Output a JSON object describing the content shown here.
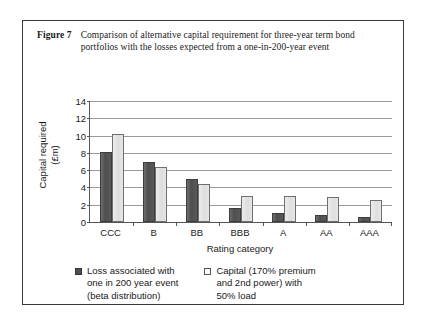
{
  "figure": {
    "label": "Figure 7",
    "caption": "Comparison of alternative capital requirement for three-year term bond portfolios with the losses expected from a one-in-200-year event"
  },
  "chart_data": {
    "type": "bar",
    "title": "",
    "xlabel": "Rating category",
    "ylabel": "Capital required (£m)",
    "ylabel_line1": "Capital required",
    "ylabel_line2": "(£m)",
    "categories": [
      "CCC",
      "B",
      "BB",
      "BBB",
      "A",
      "AA",
      "AAA"
    ],
    "ylim": [
      0,
      14
    ],
    "yticks": [
      0,
      2,
      4,
      6,
      8,
      10,
      12,
      14
    ],
    "grid": true,
    "legend_position": "bottom",
    "series": [
      {
        "name": "Loss associated with one in 200 year event (beta distribution)",
        "color": "#4f4f4f",
        "values": [
          8.1,
          7.0,
          5.0,
          1.6,
          1.1,
          0.8,
          0.6
        ]
      },
      {
        "name": "Capital (170% premium and 2nd power) with 50% load",
        "color": "#e6e6e6",
        "values": [
          10.2,
          6.4,
          4.4,
          3.0,
          3.0,
          2.9,
          2.6
        ]
      }
    ]
  },
  "legend": {
    "items": [
      {
        "swatch": "dark",
        "text": "Loss associated with\none in 200 year event\n(beta distribution)"
      },
      {
        "swatch": "light",
        "text": "Capital (170% premium\nand 2nd power) with\n50% load"
      }
    ]
  }
}
